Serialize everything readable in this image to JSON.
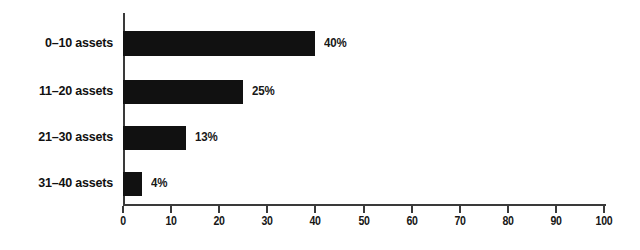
{
  "chart_data": {
    "type": "bar",
    "orientation": "horizontal",
    "title": "",
    "subtitle": "",
    "xlabel": "",
    "ylabel": "",
    "categories": [
      "0–10 assets",
      "11–20 assets",
      "21–30 assets",
      "31–40 assets"
    ],
    "values": [
      40,
      25,
      13,
      4
    ],
    "value_labels": [
      "40%",
      "25%",
      "13%",
      "4%"
    ],
    "xlim": [
      0,
      100
    ],
    "xticks": [
      0,
      10,
      20,
      30,
      40,
      50,
      60,
      70,
      80,
      90,
      100
    ],
    "xtick_labels": [
      "0",
      "10",
      "20",
      "30",
      "40",
      "50",
      "60",
      "70",
      "80",
      "90",
      "100"
    ],
    "grid": false,
    "legend": null,
    "legend_position": "none",
    "bar_color": "#111111",
    "axis_color": "#3a3a3a",
    "text_color": "#171717",
    "background_color": "#ffffff"
  }
}
